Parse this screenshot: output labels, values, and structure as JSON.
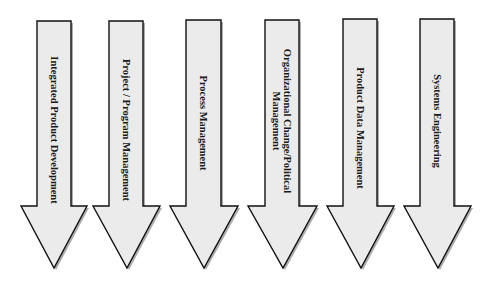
{
  "diagram": {
    "title": "",
    "arrow_direction": "down",
    "text_orientation": "rotated-90-clockwise",
    "colors": {
      "arrow_fill": "#ebebeb",
      "arrow_outline": "#111111",
      "shadow": "#6a6a6a",
      "text": "#1a1a1a",
      "background": "#ffffff"
    },
    "arrows": [
      {
        "id": "integrated-product-development",
        "lines": [
          "Integrated Product Development"
        ]
      },
      {
        "id": "project-program-management",
        "lines": [
          "Project / Program Management"
        ]
      },
      {
        "id": "process-management",
        "lines": [
          "Process Management"
        ]
      },
      {
        "id": "organizational-change-political-management",
        "lines": [
          "Organizational Change/Political",
          "Management"
        ]
      },
      {
        "id": "product-data-management",
        "lines": [
          "Product Data Management"
        ]
      },
      {
        "id": "systems-engineering",
        "lines": [
          "Systems Engineering"
        ]
      }
    ]
  }
}
